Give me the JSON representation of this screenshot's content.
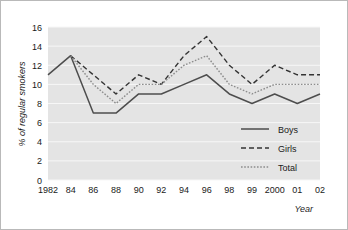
{
  "chart_data": {
    "type": "line",
    "title": "",
    "xlabel": "Year",
    "ylabel": "% of regular smokers",
    "x": [
      "1982",
      "84",
      "86",
      "88",
      "90",
      "92",
      "94",
      "96",
      "98",
      "99",
      "2000",
      "01",
      "02"
    ],
    "xtick_labels": [
      "1982",
      "84",
      "86",
      "88",
      "90",
      "92",
      "94",
      "96",
      "98",
      "99",
      "2000",
      "01",
      "02"
    ],
    "ytick_labels": [
      "0",
      "2",
      "4",
      "6",
      "8",
      "10",
      "12",
      "14",
      "16"
    ],
    "ytick_values": [
      0,
      2,
      4,
      6,
      8,
      10,
      12,
      14,
      16
    ],
    "ylim": [
      0,
      16
    ],
    "grid": "horizontal",
    "legend_position": "bottom-right",
    "series": [
      {
        "name": "Boys",
        "style": "solid",
        "color": "#4d4d4d",
        "values": [
          11,
          13,
          7,
          7,
          9,
          9,
          10,
          11,
          9,
          8,
          9,
          8,
          9
        ]
      },
      {
        "name": "Girls",
        "style": "dashed",
        "color": "#333333",
        "values": [
          null,
          13,
          11,
          9,
          11,
          10,
          13,
          15,
          12,
          10,
          12,
          11,
          11
        ]
      },
      {
        "name": "Total",
        "style": "dotted",
        "color": "#8c8c8c",
        "values": [
          null,
          13,
          10,
          8,
          10,
          10,
          12,
          13,
          10,
          9,
          10,
          10,
          10
        ]
      }
    ]
  },
  "legend": {
    "items": [
      {
        "label": "Boys"
      },
      {
        "label": "Girls"
      },
      {
        "label": "Total"
      }
    ]
  },
  "axes": {
    "y_title": "% of regular smokers",
    "x_title": "Year"
  },
  "colors": {
    "plot_background": "#e4e4e4",
    "gridline": "#f7f7f7",
    "border": "#b9b9b9",
    "boys": "#4d4d4d",
    "girls": "#333333",
    "total": "#8c8c8c"
  }
}
